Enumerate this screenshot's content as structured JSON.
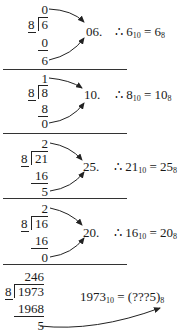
{
  "blocks": [
    {
      "quotient": "0",
      "divisor": "8",
      "dividend": "6",
      "product": "0",
      "remainder": "6",
      "result": "06.",
      "conclusion": {
        "prefix": "∴ ",
        "lhs": "6",
        "lhs_base": "10",
        "eq": " = ",
        "rhs": "6",
        "rhs_base": "8"
      }
    },
    {
      "quotient": "1",
      "divisor": "8",
      "dividend": "8",
      "product": "8",
      "remainder": "0",
      "result": "10.",
      "conclusion": {
        "prefix": "∴ ",
        "lhs": "8",
        "lhs_base": "10",
        "eq": " = ",
        "rhs": "10",
        "rhs_base": "8"
      }
    },
    {
      "quotient": "2",
      "divisor": "8",
      "dividend": "21",
      "product": "16",
      "remainder": "5",
      "result": "25.",
      "conclusion": {
        "prefix": "∴ ",
        "lhs": "21",
        "lhs_base": "10",
        "eq": " = ",
        "rhs": "25",
        "rhs_base": "8"
      }
    },
    {
      "quotient": "2",
      "divisor": "8",
      "dividend": "16",
      "product": "16",
      "remainder": "0",
      "result": "20.",
      "conclusion": {
        "prefix": "∴ ",
        "lhs": "16",
        "lhs_base": "10",
        "eq": " = ",
        "rhs": "20",
        "rhs_base": "8"
      }
    },
    {
      "quotient": "246",
      "divisor": "8",
      "dividend": "1973",
      "product": "1968",
      "remainder": "5",
      "conclusion": {
        "lhs": "1973",
        "lhs_base": "10",
        "eq": " = ",
        "rhs": "(???5)",
        "rhs_base": "8"
      }
    }
  ]
}
